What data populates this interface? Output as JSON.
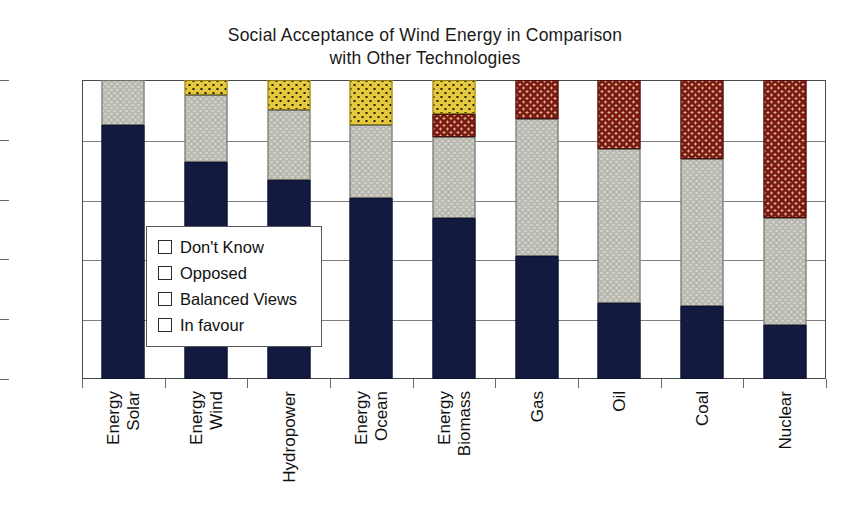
{
  "chart_data": {
    "type": "bar",
    "subtype": "stacked-percentage-column",
    "title": "Social Acceptance of Wind Energy in Comparison\nwith Other Technologies",
    "xlabel": "",
    "ylabel": "",
    "ylim": [
      0,
      100
    ],
    "ytick_labels": [
      "0%",
      "20%",
      "40%",
      "60%",
      "80%",
      "100%"
    ],
    "ytick_values": [
      0,
      20,
      40,
      60,
      80,
      100
    ],
    "grid": true,
    "legend_position": "inside-left-middle",
    "categories": [
      "Solar Energy",
      "Wind Energy",
      "Hydropower",
      "Ocean Energy",
      "Biomass Energy",
      "Gas",
      "Oil",
      "Coal",
      "Nuclear"
    ],
    "category_lines": [
      [
        "Solar",
        "Energy"
      ],
      [
        "Wind",
        "Energy"
      ],
      [
        "Hydropower"
      ],
      [
        "Ocean",
        "Energy"
      ],
      [
        "Biomass",
        "Energy"
      ],
      [
        "Gas"
      ],
      [
        "Oil"
      ],
      [
        "Coal"
      ],
      [
        "Nuclear"
      ]
    ],
    "series": [
      {
        "name": "In favour",
        "key": "infavour",
        "color": "#131a40",
        "values": [
          85,
          72.5,
          66.5,
          60.5,
          54,
          41,
          25.5,
          24.5,
          18
        ]
      },
      {
        "name": "Balanced Views",
        "key": "balanced",
        "color": "#b9b9b1",
        "values": [
          15,
          22.5,
          23.5,
          24.5,
          27,
          46,
          51.5,
          49,
          36
        ]
      },
      {
        "name": "Opposed",
        "key": "opposed",
        "color": "#7b1a14",
        "values": [
          0,
          0,
          0,
          0,
          7.5,
          13,
          23,
          26.5,
          46
        ]
      },
      {
        "name": "Don't Know",
        "key": "dontknow",
        "color": "#e6c83c",
        "values": [
          0,
          5,
          10,
          15,
          11.5,
          0,
          0,
          0,
          0
        ]
      }
    ],
    "stack_order_bottom_to_top": [
      "infavour",
      "balanced",
      "opposed",
      "dontknow"
    ],
    "legend_order_top_to_bottom": [
      "Don't Know",
      "Opposed",
      "Balanced Views",
      "In favour"
    ]
  }
}
